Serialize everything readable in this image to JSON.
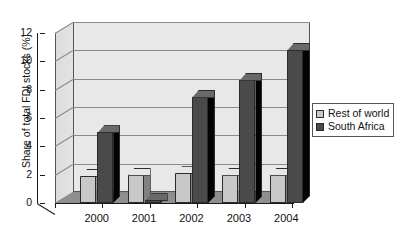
{
  "chart_data": {
    "type": "bar",
    "title": "",
    "subtitle": "",
    "xlabel": "",
    "ylabel": "Share of total FDI stocks (%)",
    "categories": [
      "2000",
      "2001",
      "2002",
      "2003",
      "2004"
    ],
    "series": [
      {
        "name": "Rest of world",
        "color": "#c8c8c8",
        "values": [
          1.9,
          2.0,
          2.1,
          2.0,
          2.0
        ]
      },
      {
        "name": "South Africa",
        "color": "#4a4a4a",
        "values": [
          5.0,
          0.2,
          7.5,
          8.7,
          10.8
        ]
      }
    ],
    "ylim": [
      0,
      12
    ],
    "yticks": [
      "0",
      "2",
      "4",
      "6",
      "8",
      "10",
      "12"
    ],
    "ytick_values": [
      0,
      2,
      4,
      6,
      8,
      10,
      12
    ],
    "grid": true,
    "legend_position": "right",
    "style": "3d-grayscale"
  },
  "legend": {
    "items": [
      {
        "label": "Rest of world"
      },
      {
        "label": "South Africa"
      }
    ]
  },
  "colors": {
    "series_rest_of_world": "#c8c8c8",
    "series_south_africa": "#4a4a4a",
    "plot_background": "#e8e8e8",
    "floor": "#8f8f8f",
    "gridline": "#8a8a8a",
    "axis": "#1a1a1a",
    "text": "#111111"
  }
}
